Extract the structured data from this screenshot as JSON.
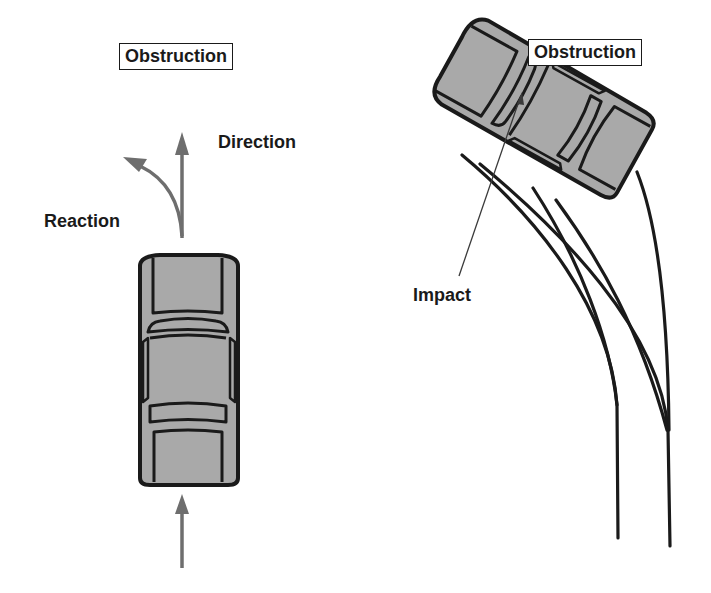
{
  "left_scenario": {
    "obstruction_label": "Obstruction",
    "direction_label": "Direction",
    "reaction_label": "Reaction"
  },
  "right_scenario": {
    "obstruction_label": "Obstruction",
    "impact_label": "Impact"
  },
  "colors": {
    "car_fill": "#a9a9a9",
    "outline": "#1a1a1a",
    "arrow": "#6e6e6e",
    "background": "#ffffff"
  }
}
